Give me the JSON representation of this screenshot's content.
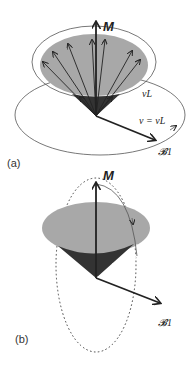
{
  "panels": [
    {
      "id": "a",
      "label": "(a)",
      "vector_label": "M",
      "cone_label": "v_L",
      "cone_label_text": "νL",
      "frequency_label": "ν = νL",
      "field_label": "𝓑1",
      "description": "Precessing spin vectors forming a cone about M, rotating field B1 at frequency ν = νL"
    },
    {
      "id": "b",
      "label": "(b)",
      "vector_label": "M",
      "field_label": "𝓑1",
      "description": "Magnetization M tipped by B1 along dotted circular path"
    }
  ],
  "colors": {
    "cone_top": "#a8a8a8",
    "cone_side": "#333333",
    "lines": "#222222",
    "ellipse": "#555555"
  }
}
